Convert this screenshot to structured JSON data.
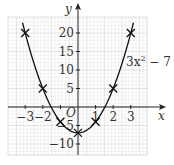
{
  "chart_data": {
    "type": "line",
    "title": "",
    "xlabel": "x",
    "ylabel": "y",
    "curve_label": "3x² − 7",
    "origin_label": "O",
    "x": [
      -3,
      -2,
      -1,
      0,
      1,
      2,
      3
    ],
    "series": [
      {
        "name": "3x² − 7",
        "values": [
          20,
          5,
          -4,
          -7,
          -4,
          5,
          20
        ]
      }
    ],
    "x_ticks": [
      -3,
      -2,
      -1,
      1,
      2,
      3
    ],
    "x_tick_labels": [
      "−3",
      "−2",
      "−1",
      "1",
      "2",
      "3"
    ],
    "y_ticks": [
      20,
      15,
      10,
      5,
      -5,
      -10
    ],
    "y_tick_labels": [
      "20",
      "15",
      "10",
      "5",
      "−5",
      "−10"
    ],
    "xlim": [
      -3.5,
      4.5
    ],
    "ylim": [
      -13,
      27
    ],
    "grid": true,
    "legend": "none",
    "marker": "x",
    "colors": {
      "curve": "#111111",
      "axis": "#222222",
      "grid_major": "#c8c8c8",
      "grid_minor": "#e6e6e6",
      "text": "#333333"
    }
  }
}
